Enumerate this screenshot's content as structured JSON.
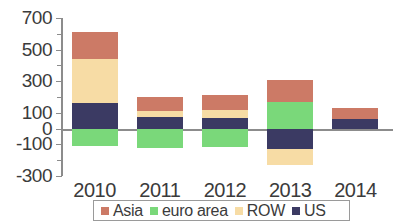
{
  "chart_data": {
    "type": "bar",
    "stacked": true,
    "title": "",
    "subtitle": "",
    "xlabel": "",
    "ylabel": "",
    "categories": [
      "2010",
      "2011",
      "2012",
      "2013",
      "2014"
    ],
    "ylim": [
      -300,
      700
    ],
    "yticks": [
      -300,
      -100,
      0,
      100,
      300,
      500,
      700
    ],
    "ytick_labels": [
      "-300",
      "-100",
      "0",
      "100",
      "300",
      "500",
      "700"
    ],
    "grid": false,
    "legend_position": "bottom",
    "series": [
      {
        "name": "Asia",
        "color": "#cc7a66",
        "values": [
          170,
          90,
          100,
          140,
          70
        ]
      },
      {
        "name": "euro area",
        "color": "#7ad87a",
        "values": [
          -110,
          -120,
          -115,
          170,
          0
        ]
      },
      {
        "name": "ROW",
        "color": "#f7dca5",
        "values": [
          280,
          35,
          45,
          -100,
          0
        ]
      },
      {
        "name": "US",
        "color": "#3b3a63",
        "values": [
          160,
          75,
          70,
          -130,
          60
        ]
      }
    ]
  },
  "legend": {
    "items": [
      {
        "label": "Asia",
        "color": "#cc7a66",
        "swatch_name": "legend-swatch-asia"
      },
      {
        "label": "euro area",
        "color": "#7ad87a",
        "swatch_name": "legend-swatch-euro-area"
      },
      {
        "label": "ROW",
        "color": "#f7dca5",
        "swatch_name": "legend-swatch-row"
      },
      {
        "label": "US",
        "color": "#3b3a63",
        "swatch_name": "legend-swatch-us"
      }
    ]
  },
  "axis": {
    "y_labels": [
      "700",
      "500",
      "300",
      "100",
      "0",
      "-100",
      "-300"
    ],
    "x_labels": [
      "2010",
      "2011",
      "2012",
      "2013",
      "2014"
    ]
  }
}
